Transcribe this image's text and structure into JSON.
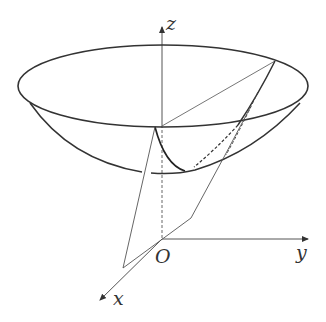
{
  "diagram": {
    "type": "3d-coordinate-figure",
    "labels": {
      "z_axis": "z",
      "y_axis": "y",
      "x_axis": "x",
      "origin": "O"
    },
    "colors": {
      "stroke": "#333333",
      "thin_stroke": "#555555",
      "background": "#ffffff"
    }
  }
}
